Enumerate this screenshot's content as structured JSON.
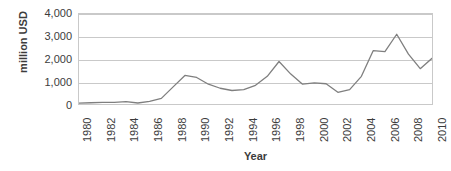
{
  "chart_data": {
    "type": "line",
    "title": "",
    "xlabel": "Year",
    "ylabel": "million USD",
    "xlim": [
      1980,
      2010
    ],
    "ylim": [
      0,
      4000
    ],
    "grid": true,
    "legend": false,
    "series_color": "#7f7f7f",
    "x": [
      1980,
      1981,
      1982,
      1983,
      1984,
      1985,
      1986,
      1987,
      1988,
      1989,
      1990,
      1991,
      1992,
      1993,
      1994,
      1995,
      1996,
      1997,
      1998,
      1999,
      2000,
      2001,
      2002,
      2003,
      2004,
      2005,
      2006,
      2007,
      2008,
      2009,
      2010
    ],
    "series": [
      {
        "name": "million USD",
        "values": [
          40,
          55,
          70,
          75,
          110,
          45,
          120,
          250,
          760,
          1270,
          1180,
          880,
          700,
          600,
          640,
          830,
          1230,
          1890,
          1330,
          880,
          940,
          900,
          520,
          640,
          1230,
          2370,
          2330,
          3100,
          2220,
          1570,
          2030
        ]
      }
    ],
    "yticks": [
      0,
      1000,
      2000,
      3000,
      4000
    ],
    "ytick_labels": [
      "0",
      "1,000",
      "2,000",
      "3,000",
      "4,000"
    ],
    "xticks": [
      1980,
      1982,
      1984,
      1986,
      1988,
      1990,
      1992,
      1994,
      1996,
      1998,
      2000,
      2002,
      2004,
      2006,
      2008,
      2010
    ],
    "xtick_labels": [
      "1980",
      "1982",
      "1984",
      "1986",
      "1988",
      "1990",
      "1992",
      "1994",
      "1996",
      "1998",
      "2000",
      "2002",
      "2004",
      "2006",
      "2008",
      "2010"
    ]
  }
}
